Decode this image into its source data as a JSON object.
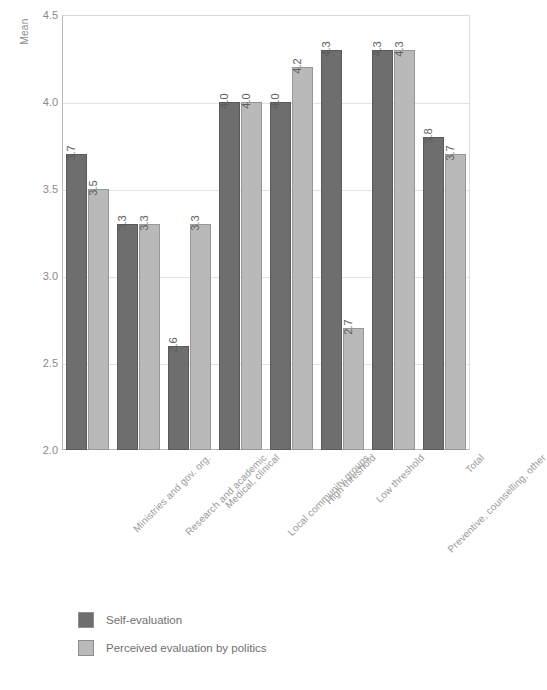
{
  "chart_data": {
    "type": "bar",
    "title": "",
    "xlabel": "",
    "ylabel": "Mean",
    "ylim": [
      2.0,
      4.5
    ],
    "yticks": [
      "2.0",
      "2.5",
      "3.0",
      "3.5",
      "4.0",
      "4.5"
    ],
    "grid": true,
    "legend_position": "bottom-left",
    "categories": [
      "Ministries and gov. org.",
      "Research and academic",
      "Medical, clinical",
      "Local community groups",
      "High threshold",
      "Low threshold",
      "Preventive, counselling, other",
      "Total"
    ],
    "series": [
      {
        "name": "Self-evaluation",
        "color": "#6e6e6e",
        "values": [
          3.7,
          3.3,
          2.6,
          4.0,
          4.0,
          4.3,
          4.3,
          3.8
        ],
        "labels": [
          "3.7",
          "3.3",
          "2.6",
          "4.0",
          "4.0",
          "4.3",
          "4.3",
          "3.8"
        ]
      },
      {
        "name": "Perceived evaluation by politics",
        "color": "#b9b9b9",
        "values": [
          3.5,
          3.3,
          3.3,
          4.0,
          4.2,
          2.7,
          4.3,
          3.7
        ],
        "labels": [
          "3.5",
          "3.3",
          "3.3",
          "4.0",
          "4.2",
          "2.7",
          "4.3",
          "3.7"
        ]
      }
    ]
  },
  "axis": {
    "y_title": "Mean"
  },
  "legend": {
    "items": [
      {
        "label": "Self-evaluation",
        "color": "#6e6e6e"
      },
      {
        "label": "Perceived evaluation by politics",
        "color": "#b9b9b9"
      }
    ]
  }
}
